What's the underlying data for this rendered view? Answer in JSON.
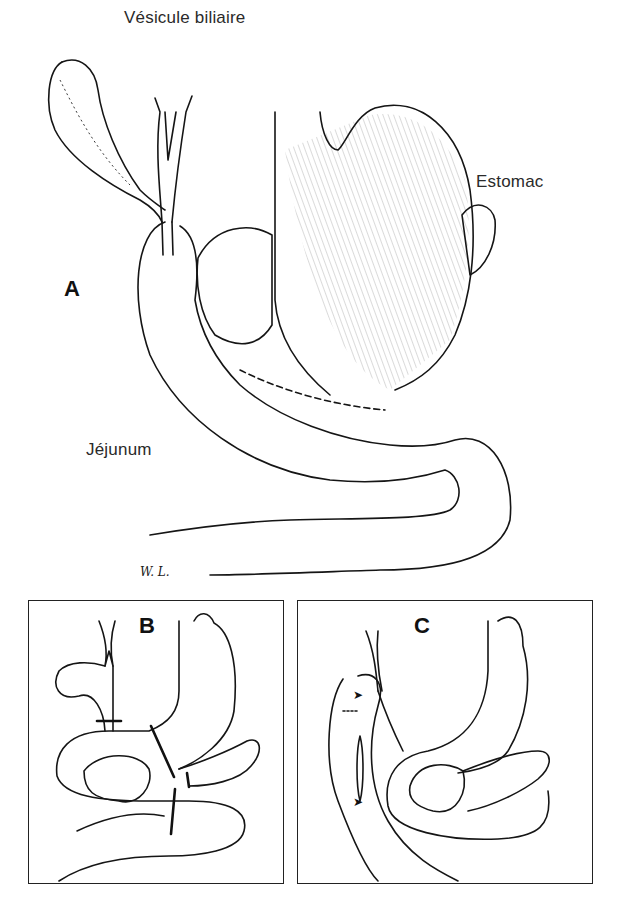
{
  "figure": {
    "panel_a": {
      "letter": "A",
      "labels": {
        "gallbladder": "Vésicule biliaire",
        "stomach": "Estomac",
        "jejunum": "Jéjunum"
      },
      "signature": "W. L."
    },
    "panel_b": {
      "letter": "B"
    },
    "panel_c": {
      "letter": "C"
    }
  },
  "colors": {
    "ink": "#151515",
    "background": "#ffffff"
  }
}
